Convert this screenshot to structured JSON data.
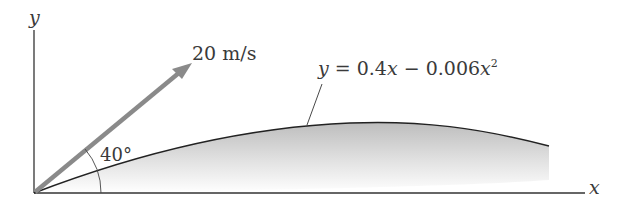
{
  "diagram": {
    "axes": {
      "x_label": "x",
      "y_label": "y"
    },
    "velocity": {
      "label": "20 m/s",
      "magnitude": "20",
      "unit": "m/s",
      "arrow_color": "#8a8a8a"
    },
    "angle": {
      "label": "40°"
    },
    "trajectory": {
      "equation_lhs": "y",
      "equation_eq": " = 0.4",
      "equation_x1": "x",
      "equation_mid": " − 0.006",
      "equation_x2": "x",
      "equation_exp": "2",
      "line_color": "#222222",
      "shade_color": "#c8c8c8"
    }
  }
}
